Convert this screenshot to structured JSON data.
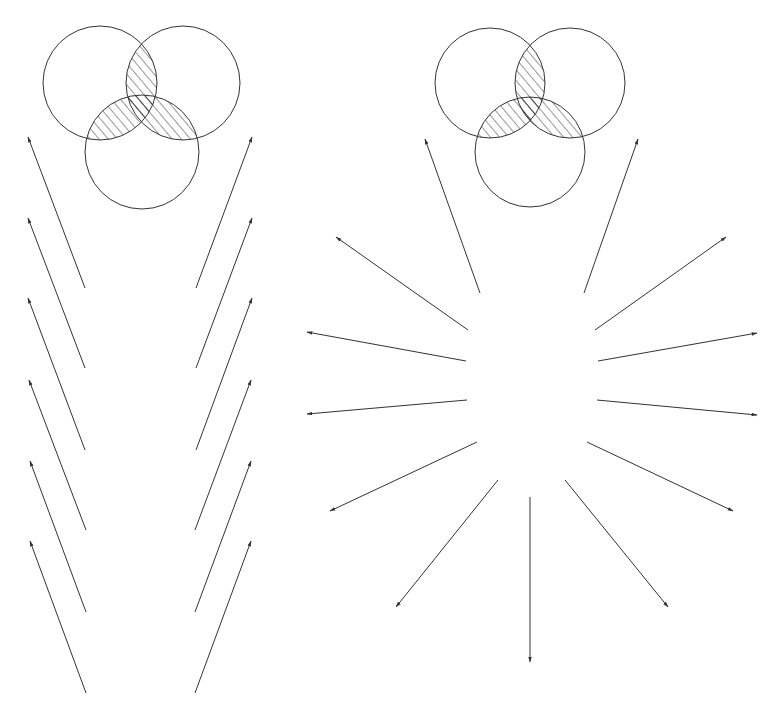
{
  "diagram": {
    "stroke_color": "#333333",
    "hatch_color": "#333333",
    "background": "#ffffff",
    "left_venn": {
      "circles": [
        {
          "cx": 100,
          "cy": 83,
          "r": 57
        },
        {
          "cx": 183,
          "cy": 83,
          "r": 57
        },
        {
          "cx": 142,
          "cy": 152,
          "r": 57
        }
      ],
      "hatched_regions": [
        "A∩B",
        "A∩C",
        "B∩C"
      ]
    },
    "right_venn": {
      "circles": [
        {
          "cx": 490,
          "cy": 83,
          "r": 55
        },
        {
          "cx": 570,
          "cy": 83,
          "r": 55
        },
        {
          "cx": 530,
          "cy": 152,
          "r": 55
        }
      ],
      "hatched_regions": [
        "A∩B",
        "A∩C",
        "B∩C"
      ]
    },
    "parallel_arrows_left": [
      {
        "x1": 85,
        "y1": 288,
        "x2": 28,
        "y2": 137
      },
      {
        "x1": 85,
        "y1": 368,
        "x2": 28,
        "y2": 218
      },
      {
        "x1": 85,
        "y1": 450,
        "x2": 28,
        "y2": 298
      },
      {
        "x1": 86,
        "y1": 530,
        "x2": 29,
        "y2": 380
      },
      {
        "x1": 86,
        "y1": 612,
        "x2": 30,
        "y2": 461
      },
      {
        "x1": 86,
        "y1": 693,
        "x2": 30,
        "y2": 541
      }
    ],
    "parallel_arrows_right": [
      {
        "x1": 196,
        "y1": 288,
        "x2": 252,
        "y2": 137
      },
      {
        "x1": 196,
        "y1": 368,
        "x2": 252,
        "y2": 218
      },
      {
        "x1": 196,
        "y1": 450,
        "x2": 252,
        "y2": 298
      },
      {
        "x1": 195,
        "y1": 530,
        "x2": 251,
        "y2": 380
      },
      {
        "x1": 195,
        "y1": 612,
        "x2": 251,
        "y2": 461
      },
      {
        "x1": 195,
        "y1": 693,
        "x2": 251,
        "y2": 541
      }
    ],
    "radial_arrows": [
      {
        "x1": 480,
        "y1": 293,
        "x2": 425,
        "y2": 139
      },
      {
        "x1": 584,
        "y1": 293,
        "x2": 638,
        "y2": 139
      },
      {
        "x1": 468,
        "y1": 330,
        "x2": 336,
        "y2": 237
      },
      {
        "x1": 595,
        "y1": 330,
        "x2": 726,
        "y2": 237
      },
      {
        "x1": 466,
        "y1": 361,
        "x2": 307,
        "y2": 332
      },
      {
        "x1": 598,
        "y1": 361,
        "x2": 757,
        "y2": 333
      },
      {
        "x1": 467,
        "y1": 400,
        "x2": 307,
        "y2": 414
      },
      {
        "x1": 597,
        "y1": 400,
        "x2": 757,
        "y2": 415
      },
      {
        "x1": 477,
        "y1": 442,
        "x2": 330,
        "y2": 511
      },
      {
        "x1": 587,
        "y1": 442,
        "x2": 733,
        "y2": 511
      },
      {
        "x1": 498,
        "y1": 480,
        "x2": 396,
        "y2": 607
      },
      {
        "x1": 565,
        "y1": 480,
        "x2": 668,
        "y2": 607
      },
      {
        "x1": 530,
        "y1": 497,
        "x2": 530,
        "y2": 662
      }
    ]
  }
}
